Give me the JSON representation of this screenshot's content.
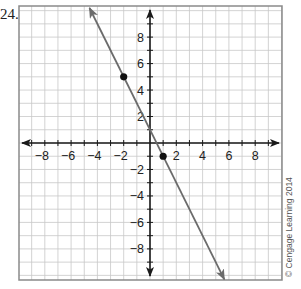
{
  "problem": {
    "number_label": "24."
  },
  "credit": {
    "text": "© Cengage Learning 2014"
  },
  "colors": {
    "grid": "#c8c8c8",
    "axis": "#1a1a1a",
    "frame": "#8a8a8a",
    "line": "#6b6b6b",
    "point": "#111111"
  },
  "chart_data": {
    "type": "line",
    "title": "",
    "xlabel": "",
    "ylabel": "",
    "xlim": [
      -10,
      10
    ],
    "ylim": [
      -10,
      10
    ],
    "grid": true,
    "x_tick_labels": [
      "−8",
      "−6",
      "−4",
      "−2",
      "2",
      "4",
      "6",
      "8"
    ],
    "y_tick_labels": [
      "8",
      "6",
      "4",
      "2",
      "−2",
      "−4",
      "−6",
      "−8"
    ],
    "series": [
      {
        "name": "line",
        "equation": "y = -2x + 1",
        "slope": -2,
        "intercept": 1,
        "x": [
          -4.5,
          5.5
        ],
        "y": [
          10,
          -10
        ]
      }
    ],
    "points": [
      {
        "x": -2,
        "y": 5
      },
      {
        "x": 1,
        "y": -1
      }
    ]
  }
}
